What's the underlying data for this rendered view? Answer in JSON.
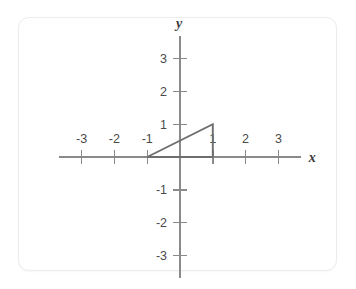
{
  "figure": {
    "background_color": "#ffffff",
    "card": {
      "background_color": "#ffffff",
      "border_color": "#ececec"
    },
    "axes": {
      "x_axis_label": "x",
      "y_axis_label": "y",
      "axis_color": "#8a8a8a",
      "label_color": "#4a4a4a",
      "x_ticks": [
        {
          "value": -3,
          "label": "-3"
        },
        {
          "value": -2,
          "label": "-2"
        },
        {
          "value": -1,
          "label": "-1"
        },
        {
          "value": 1,
          "label": "1"
        },
        {
          "value": 2,
          "label": "2"
        },
        {
          "value": 3,
          "label": "3"
        }
      ],
      "y_ticks": [
        {
          "value": 3,
          "label": "3"
        },
        {
          "value": 2,
          "label": "2"
        },
        {
          "value": 1,
          "label": "1"
        },
        {
          "value": -1,
          "label": "-1"
        },
        {
          "value": -2,
          "label": "-2"
        },
        {
          "value": -3,
          "label": "-3"
        }
      ]
    }
  },
  "chart_data": {
    "type": "scatter",
    "title": "",
    "xlabel": "x",
    "ylabel": "y",
    "xlim": [
      -3.7,
      3.7
    ],
    "ylim": [
      -3.7,
      3.7
    ],
    "grid": false,
    "legend": "none",
    "xticks": [
      -3,
      -2,
      -1,
      1,
      2,
      3
    ],
    "yticks": [
      -3,
      -2,
      -1,
      1,
      2,
      3
    ],
    "xticklabels": [
      "-3",
      "-2",
      "-1",
      "1",
      "2",
      "3"
    ],
    "yticklabels": [
      "-3",
      "-2",
      "-1",
      "1",
      "2",
      "3"
    ],
    "annotations": [
      {
        "name": "right-triangle",
        "type": "polygon",
        "closed": true,
        "stroke": "#6e6e6e",
        "fill": "none",
        "vertices": [
          {
            "x": -1,
            "y": 0
          },
          {
            "x": 1,
            "y": 1
          },
          {
            "x": 1,
            "y": 0
          }
        ]
      }
    ]
  }
}
